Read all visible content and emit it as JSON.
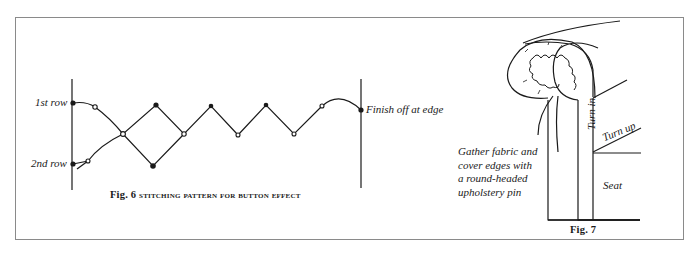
{
  "fig6": {
    "label_row1": "1st row",
    "label_row2": "2nd row",
    "label_finish": "Finish off at edge",
    "caption_num": "Fig. 6",
    "caption_text": "Stitching pattern for button effect"
  },
  "fig7": {
    "note_lines": [
      "Gather fabric and",
      "cover edges with",
      "a round-headed",
      "upholstery pin"
    ],
    "label_turn_in": "Turn in",
    "label_turn_up": "Turn up",
    "label_seat": "Seat",
    "caption": "Fig. 7"
  },
  "colors": {
    "line": "#1a1a1a",
    "frame": "#8a8a8a",
    "background": "#ffffff"
  }
}
